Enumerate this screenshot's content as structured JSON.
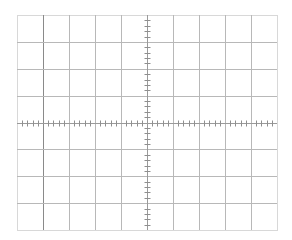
{
  "graticule": {
    "left": 17,
    "top": 15,
    "width": 260,
    "height": 215,
    "h_divisions": 10,
    "v_divisions": 8,
    "minor_ticks_per_division": 5,
    "tick_length": 6,
    "colors": {
      "background": "#ffffff",
      "border": "#d8d8d8",
      "grid_line": "#b8b8b8",
      "grid_line_strong": "#8a8a8a",
      "axis": "#9a9a9a",
      "tick": "#8f8f8f"
    }
  }
}
